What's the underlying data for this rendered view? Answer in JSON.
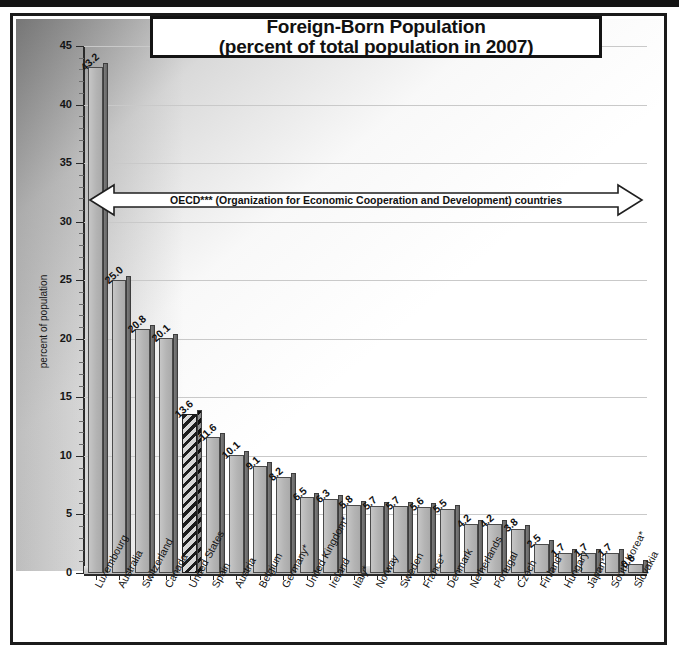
{
  "title": {
    "line1": "Foreign-Born Population",
    "line2": "(percent of total population in 2007)"
  },
  "annotation": {
    "text": "OECD*** (Organization for Economic Cooperation and Development) countries"
  },
  "axis": {
    "ylabel": "percent of population",
    "yticks": [
      "0",
      "5",
      "10",
      "15",
      "20",
      "25",
      "30",
      "35",
      "40",
      "45"
    ]
  },
  "chart_data": {
    "type": "bar",
    "title": "Foreign-Born Population (percent of total population in 2007)",
    "xlabel": "",
    "ylabel": "percent of population",
    "ylim": [
      0,
      45
    ],
    "ytick_step": 5,
    "grid": true,
    "legend": null,
    "highlight": "United States",
    "annotations": [
      "OECD*** (Organization for Economic Cooperation and Development) countries"
    ],
    "categories": [
      "Luxembourg",
      "Australia",
      "Switzerland",
      "Canada",
      "United States",
      "Spain",
      "Austria",
      "Belgium",
      "Germany*",
      "United Kingdom*",
      "Ireland",
      "Italy*",
      "Norway",
      "Sweden",
      "France*",
      "Denmark",
      "Netherlands",
      "Portugal",
      "Czech",
      "Finland",
      "Hungary",
      "Japan*",
      "South Korea*",
      "Slovakia"
    ],
    "values": [
      43.2,
      25.0,
      20.8,
      20.1,
      13.6,
      11.6,
      10.1,
      9.1,
      8.2,
      6.5,
      6.3,
      5.8,
      5.7,
      5.7,
      5.6,
      5.5,
      4.2,
      4.2,
      3.8,
      2.5,
      1.7,
      1.7,
      1.7,
      0.8
    ],
    "value_labels": [
      "43.2",
      "25.0",
      "20.8",
      "20.1",
      "13.6",
      "11.6",
      "10.1",
      "9.1",
      "8.2",
      "6.5",
      "6.3",
      "5.8",
      "5.7",
      "5.7",
      "5.6",
      "5.5",
      "4.2",
      "4.2",
      "3.8",
      "2.5",
      "1.7",
      "1.7",
      "1.7",
      "0.8"
    ]
  },
  "colors": {
    "bar_front": "#b4b4b4",
    "bar_side": "#6e6e6e",
    "axis": "#2a2a2a",
    "grid": "#c9c9c9",
    "text": "#111111"
  }
}
